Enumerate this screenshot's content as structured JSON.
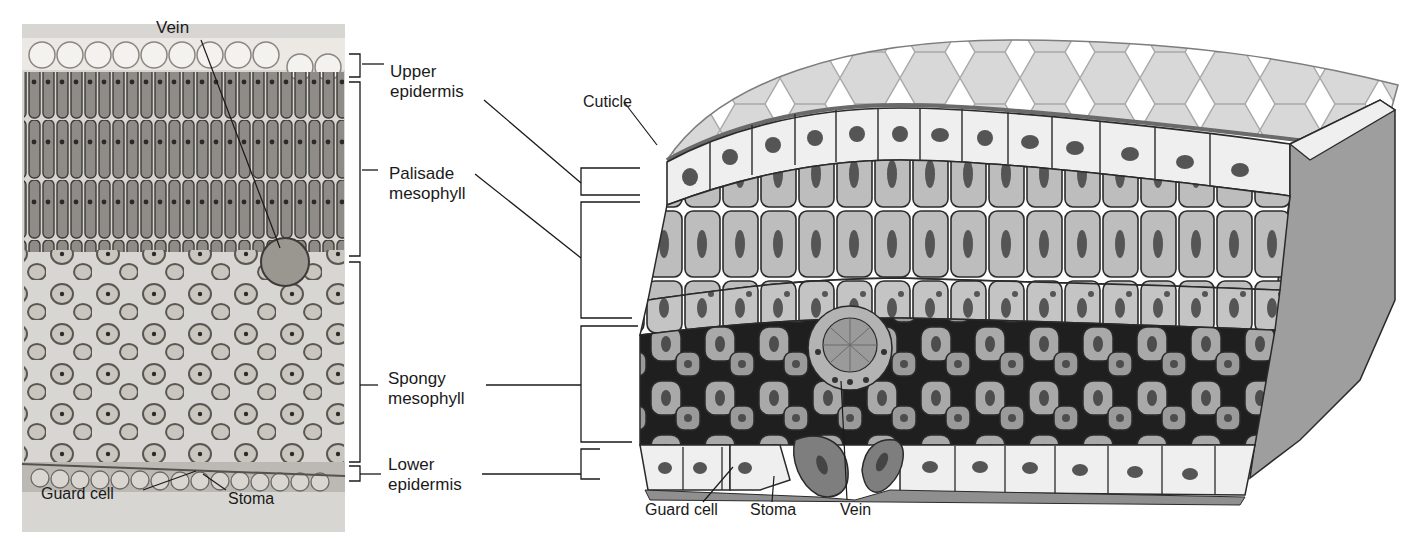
{
  "figure": {
    "micrograph": {
      "labels": {
        "vein": "Vein",
        "guard_cell": "Guard cell",
        "stoma": "Stoma"
      }
    },
    "layer_labels": {
      "upper_epidermis": "Upper\nepidermis",
      "palisade_mesophyll": "Palisade\nmesophyll",
      "spongy_mesophyll": "Spongy\nmesophyll",
      "lower_epidermis": "Lower\nepidermis"
    },
    "illustration": {
      "labels": {
        "cuticle": "Cuticle",
        "guard_cell": "Guard cell",
        "stoma": "Stoma",
        "vein": "Vein"
      }
    },
    "colors": {
      "micro_bg": "#d6d4d0",
      "micro_cell": "#8e8b86",
      "cuticle_top": "#d9d9d9",
      "epidermis": "#efefef",
      "palisade": "#b9b9b9",
      "spongy": "#a8a8a8",
      "air_space": "#1e1e1e",
      "nucleus": "#555555",
      "line": "#222222"
    }
  }
}
